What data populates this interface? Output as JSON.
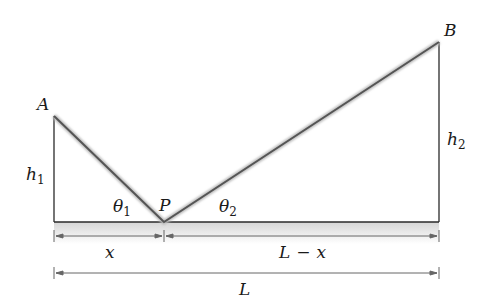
{
  "diagram": {
    "points": {
      "A": {
        "label": "A",
        "x": 54,
        "y": 116
      },
      "B": {
        "label": "B",
        "x": 439,
        "y": 42
      },
      "P": {
        "label": "P",
        "x": 164,
        "y": 222
      }
    },
    "labels": {
      "h1": {
        "main": "h",
        "sub": "1"
      },
      "h2": {
        "main": "h",
        "sub": "2"
      },
      "theta1": {
        "main": "θ",
        "sub": "1"
      },
      "theta2": {
        "main": "θ",
        "sub": "2"
      },
      "x": "x",
      "L_minus_x": {
        "left": "L",
        "op": "−",
        "right": "x"
      },
      "L": "L"
    },
    "colors": {
      "line": "#2a2a2a",
      "ray": "#555555",
      "ground_fill": "#e2e2e2",
      "dimension": "#666666"
    }
  }
}
